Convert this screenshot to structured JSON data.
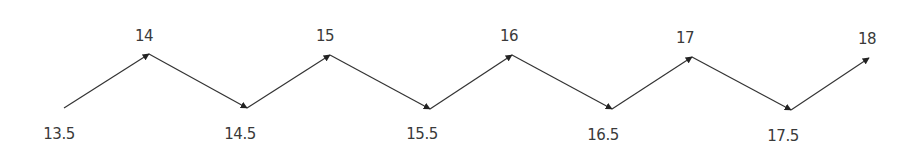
{
  "diagram": {
    "type": "zigzag-number-sequence",
    "colors": {
      "line": "#333333",
      "text": "#3a3a3a",
      "background": "#ffffff"
    },
    "nodes": [
      {
        "label": "13.5",
        "position": "bottom",
        "x": 64,
        "y": 108,
        "lx": 59,
        "ly": 139
      },
      {
        "label": "14",
        "position": "top",
        "x": 149,
        "y": 54,
        "lx": 144,
        "ly": 41
      },
      {
        "label": "14.5",
        "position": "bottom",
        "x": 247,
        "y": 108,
        "lx": 240,
        "ly": 139
      },
      {
        "label": "15",
        "position": "top",
        "x": 330,
        "y": 55,
        "lx": 325,
        "ly": 41
      },
      {
        "label": "15.5",
        "position": "bottom",
        "x": 430,
        "y": 109,
        "lx": 422,
        "ly": 139
      },
      {
        "label": "16",
        "position": "top",
        "x": 512,
        "y": 55,
        "lx": 509,
        "ly": 41
      },
      {
        "label": "16.5",
        "position": "bottom",
        "x": 612,
        "y": 109,
        "lx": 603,
        "ly": 140
      },
      {
        "label": "17",
        "position": "top",
        "x": 692,
        "y": 57,
        "lx": 685,
        "ly": 43
      },
      {
        "label": "17.5",
        "position": "bottom",
        "x": 791,
        "y": 110,
        "lx": 783,
        "ly": 141
      },
      {
        "label": "18",
        "position": "top",
        "x": 869,
        "y": 58,
        "lx": 867,
        "ly": 44
      }
    ]
  }
}
